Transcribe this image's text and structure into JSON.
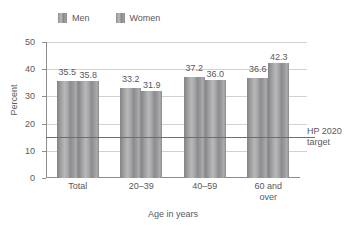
{
  "chart_data": {
    "type": "bar",
    "title": "",
    "xlabel": "Age in years",
    "ylabel": "Percent",
    "categories": [
      "Total",
      "20–39",
      "40–59",
      "60 and\nover"
    ],
    "series": [
      {
        "name": "Men",
        "values": [
          35.5,
          33.2,
          37.2,
          36.6
        ]
      },
      {
        "name": "Women",
        "values": [
          35.8,
          31.9,
          36.0,
          42.3
        ]
      }
    ],
    "value_labels": [
      [
        "35.5",
        "35.8"
      ],
      [
        "33.2",
        "31.9"
      ],
      [
        "37.2",
        "36.0"
      ],
      [
        "36.6",
        "42.3"
      ]
    ],
    "ylim": [
      0,
      50
    ],
    "yticks": [
      0,
      10,
      20,
      30,
      40,
      50
    ],
    "ytick_labels": [
      "0",
      "10",
      "20",
      "30",
      "40",
      "50"
    ],
    "grid": true,
    "legend_position": "top-left",
    "annotations": [
      {
        "name": "hp-2020-target",
        "label_line1": "HP 2020",
        "label_line2": "target",
        "value": 15.0
      }
    ],
    "colors": {
      "bar": "#a3a3a5",
      "gridline": "#d2d2d4",
      "axis": "#8d8d8f",
      "text": "#58585a",
      "target_line": "#6d6d6f",
      "background": "#ffffff"
    }
  },
  "legend": {
    "items": [
      {
        "label": "Men"
      },
      {
        "label": "Women"
      }
    ]
  }
}
